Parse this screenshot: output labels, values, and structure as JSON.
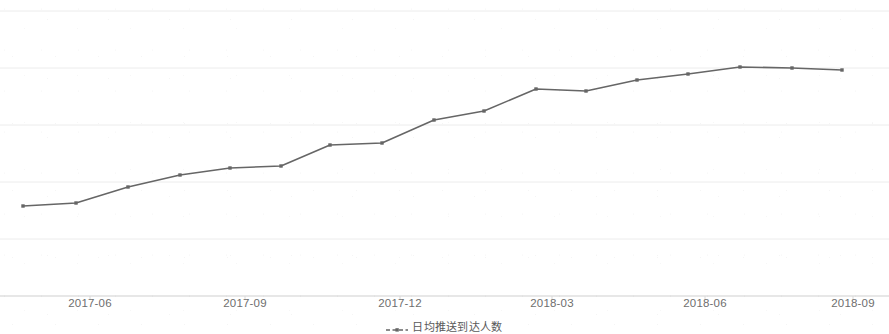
{
  "chart_data": {
    "type": "line",
    "title": "",
    "subtitle": "",
    "xlabel": "",
    "ylabel": "",
    "grid": true,
    "legend_position": "bottom-center",
    "axis_color": "#d9d9d9",
    "grid_color": "#ececec",
    "series": [
      {
        "name": "日均推送到达人数",
        "color": "#666666",
        "marker": "dot",
        "line_style": "solid",
        "x": [
          "2017-04",
          "2017-05",
          "2017-06",
          "2017-07",
          "2017-08",
          "2017-09",
          "2017-10",
          "2017-11",
          "2017-12",
          "2018-01",
          "2018-02",
          "2018-03",
          "2018-04",
          "2018-05",
          "2018-06",
          "2018-07",
          "2018-08"
        ],
        "values": [
          31.3,
          31.8,
          34.6,
          36.7,
          37.9,
          38.2,
          41.9,
          42.3,
          46.3,
          47.9,
          51.8,
          51.4,
          53.3,
          54.4,
          55.6,
          55.4,
          55.1
        ]
      }
    ],
    "x_tick_labels": [
      "2017-06",
      "2017-09",
      "2017-12",
      "2018-03",
      "2018-06",
      "2018-09"
    ],
    "x_tick_positions_px": [
      90,
      245,
      400,
      552,
      705,
      853
    ],
    "y_tick_labels": [],
    "ylim": [
      22,
      75
    ],
    "gridline_y_px": [
      11,
      68,
      125,
      182,
      239,
      296
    ],
    "point_positions_px": [
      [
        23,
        206
      ],
      [
        76,
        203
      ],
      [
        128,
        187
      ],
      [
        180,
        175
      ],
      [
        230,
        168
      ],
      [
        281,
        166
      ],
      [
        330,
        145
      ],
      [
        382,
        143
      ],
      [
        434,
        120
      ],
      [
        484,
        111
      ],
      [
        536,
        89
      ],
      [
        586,
        91
      ],
      [
        637,
        80
      ],
      [
        688,
        74
      ],
      [
        740,
        67
      ],
      [
        792,
        68
      ],
      [
        842,
        70
      ]
    ]
  },
  "legend": {
    "symbol_name": "dashed-line-with-dot",
    "items": [
      {
        "label": "日均推送到达人数",
        "color": "#666666"
      }
    ]
  },
  "axis": {
    "x_labels": [
      "2017-06",
      "2017-09",
      "2017-12",
      "2018-03",
      "2018-06",
      "2018-09"
    ]
  }
}
